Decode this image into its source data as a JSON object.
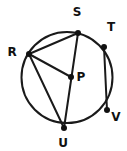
{
  "figure": {
    "background_color": "#ffffff",
    "stroke_color": "#1a1a1a",
    "label_color": "#111111",
    "width": 127,
    "height": 151
  },
  "circle": {
    "name": "circle-outline",
    "center_x": 67,
    "center_y": 77.5,
    "radius": 45.5,
    "stroke_width": 2
  },
  "points": [
    {
      "id": "R",
      "label": "R",
      "x": 29,
      "y": 54,
      "label_x": 12,
      "label_y": 52,
      "on_circle": true
    },
    {
      "id": "S",
      "label": "S",
      "x": 78,
      "y": 33,
      "label_x": 77,
      "label_y": 12,
      "on_circle": true
    },
    {
      "id": "T",
      "label": "T",
      "x": 104,
      "y": 47,
      "label_x": 111,
      "label_y": 27,
      "on_circle": true
    },
    {
      "id": "V",
      "label": "V",
      "x": 107,
      "y": 110,
      "label_x": 116,
      "label_y": 117,
      "on_circle": true
    },
    {
      "id": "U",
      "label": "U",
      "x": 64,
      "y": 128,
      "label_x": 63,
      "label_y": 143,
      "on_circle": true
    },
    {
      "id": "P",
      "label": "P",
      "x": 71,
      "y": 77,
      "label_x": 81,
      "label_y": 77,
      "on_circle": false
    }
  ],
  "segments": [
    {
      "id": "RS",
      "from": "R",
      "to": "S",
      "label": "R to S"
    },
    {
      "id": "RP",
      "from": "R",
      "to": "P",
      "label": "R to P"
    },
    {
      "id": "RU",
      "from": "R",
      "to": "U",
      "label": "R to U"
    },
    {
      "id": "SU",
      "from": "S",
      "to": "U",
      "label": "S to U through P"
    },
    {
      "id": "TV",
      "from": "T",
      "to": "V",
      "label": "T to V"
    }
  ]
}
